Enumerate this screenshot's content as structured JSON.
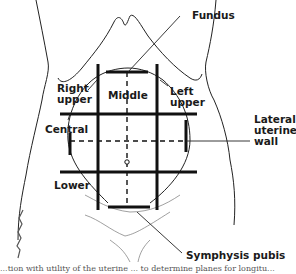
{
  "diagram": {
    "labels": {
      "fundus": "Fundus",
      "right_upper": "Right\nupper",
      "middle": "Middle",
      "left_upper": "Left\nupper",
      "central": "Central",
      "lateral_uterine_wall": "Lateral\nuterine\nwall",
      "lower": "Lower",
      "symphysis_pubis": "Symphysis pubis"
    },
    "signature": "artist signature",
    "caption": "...tion with utility of the uterine ... to determine planes for longitu..."
  }
}
